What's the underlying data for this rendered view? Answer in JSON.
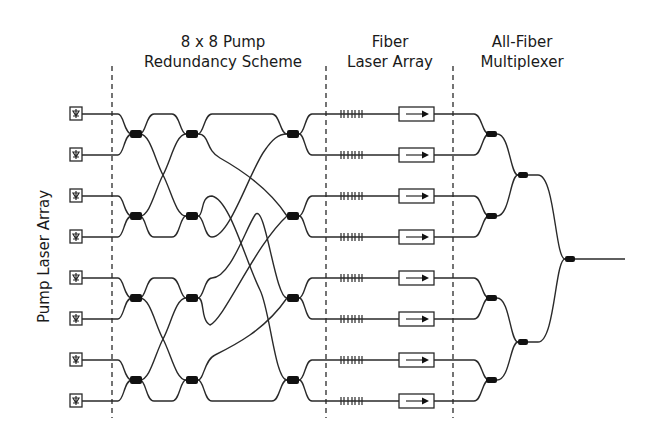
{
  "sections": {
    "pump_redundancy": {
      "line1": "8 x 8 Pump",
      "line2": "Redundancy Scheme"
    },
    "fiber_laser_array": {
      "line1": "Fiber",
      "line2": "Laser Array"
    },
    "multiplexer": {
      "line1": "All-Fiber",
      "line2": "Multiplexer"
    }
  },
  "side_label": "Pump Laser Array",
  "pump_lasers": {
    "count": 8,
    "icon": "pump-diode-icon"
  },
  "fiber_lasers": {
    "count": 8,
    "grating_icon": "fiber-bragg-grating-icon",
    "isolator_icon": "isolator-arrow-icon"
  },
  "couplers": {
    "redundancy_stages": 3,
    "per_stage": 4,
    "multiplexer_levels": 3
  },
  "colors": {
    "line": "#2a2a2a",
    "coupler": "#111111",
    "background": "#ffffff"
  }
}
